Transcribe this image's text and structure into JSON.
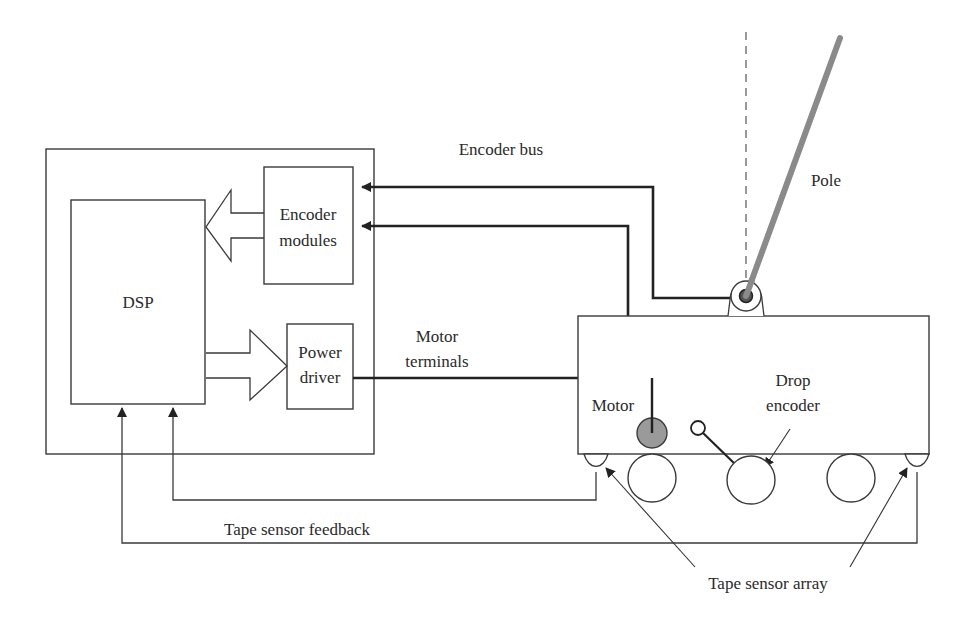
{
  "diagram": {
    "controller": {
      "dsp_label": "DSP",
      "encoder_modules": {
        "line1": "Encoder",
        "line2": "modules"
      },
      "power_driver": {
        "line1": "Power",
        "line2": "driver"
      }
    },
    "labels": {
      "encoder_bus": "Encoder bus",
      "motor_terminals": {
        "line1": "Motor",
        "line2": "terminals"
      },
      "pole": "Pole",
      "motor": "Motor",
      "drop_encoder": {
        "line1": "Drop",
        "line2": "encoder"
      },
      "tape_sensor_feedback": "Tape sensor feedback",
      "tape_sensor_array": "Tape sensor array"
    },
    "colors": {
      "line": "#222222",
      "pole": "#8a8a8a",
      "motor_fill": "#9a9a9a",
      "background": "#ffffff"
    }
  }
}
